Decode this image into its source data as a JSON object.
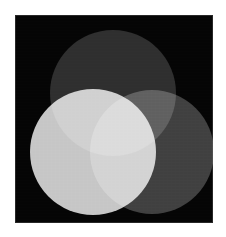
{
  "figure": {
    "canvas": {
      "width": 226,
      "height": 237,
      "background_color": "#ffffff"
    },
    "panel": {
      "name": "plot-panel",
      "x": 15,
      "y": 15,
      "width": 198,
      "height": 208,
      "background_color": "#050505",
      "border_color": "#787878"
    }
  },
  "chart_data": {
    "type": "venn",
    "title": "",
    "subtitle": "",
    "xlabel": "",
    "ylabel": "",
    "grid": false,
    "legend_position": "none",
    "background_color": "#050505",
    "blend_mode": "screen",
    "set_count": 3,
    "sets": [
      {
        "name": "top-disc",
        "label": "",
        "cx": 113,
        "cy": 93,
        "r": 63,
        "fill": "#2b2b2b",
        "luminance": 43
      },
      {
        "name": "left-disc",
        "label": "",
        "cx": 93,
        "cy": 152,
        "r": 63,
        "fill": "#c6c6c6",
        "luminance": 198
      },
      {
        "name": "right-disc",
        "label": "",
        "cx": 152,
        "cy": 152,
        "r": 62,
        "fill": "#3d3d3d",
        "luminance": 61
      }
    ],
    "regions": [
      {
        "name": "top-only",
        "members": [
          "top"
        ],
        "fill": "#2b2b2b",
        "luminance": 43
      },
      {
        "name": "left-only",
        "members": [
          "left"
        ],
        "fill": "#c6c6c6",
        "luminance": 198
      },
      {
        "name": "right-only",
        "members": [
          "right"
        ],
        "fill": "#3d3d3d",
        "luminance": 61
      },
      {
        "name": "top-left",
        "members": [
          "top",
          "left"
        ],
        "fill": "#e0e0e0",
        "luminance": 224
      },
      {
        "name": "top-right",
        "members": [
          "top",
          "right"
        ],
        "fill": "#5e5e5e",
        "luminance": 94
      },
      {
        "name": "left-right",
        "members": [
          "left",
          "right"
        ],
        "fill": "#d4d4d4",
        "luminance": 212
      },
      {
        "name": "top-left-right",
        "members": [
          "top",
          "left",
          "right"
        ],
        "fill": "#ffffff",
        "luminance": 255
      }
    ]
  }
}
